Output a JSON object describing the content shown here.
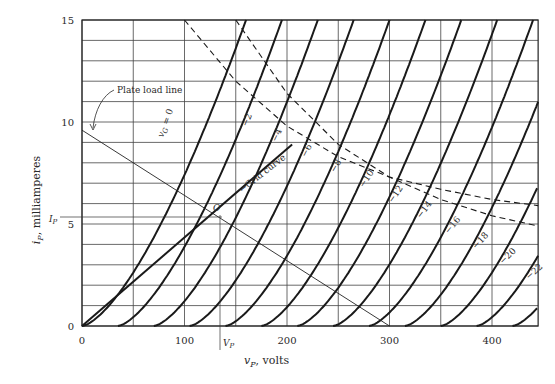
{
  "chart_data": {
    "type": "line",
    "title": "",
    "xlabel": "v_P, volts",
    "ylabel": "i_P, milliamperes",
    "xlim": [
      0,
      445
    ],
    "ylim": [
      0,
      15
    ],
    "x_ticks": [
      0,
      100,
      200,
      300,
      400
    ],
    "y_ticks": [
      0,
      5,
      10,
      15
    ],
    "grid": {
      "x_step": 50,
      "y_step": 1,
      "on": true
    },
    "legend": "none",
    "model": {
      "mu": 17.5,
      "k": 0.00741,
      "exponent": 1.5
    },
    "series": [
      {
        "name": "v_G = 0",
        "grid_voltage": 0,
        "label": "v_G = 0"
      },
      {
        "name": "-2",
        "grid_voltage": -2,
        "label": "−2"
      },
      {
        "name": "-4",
        "grid_voltage": -4,
        "label": "−4"
      },
      {
        "name": "-6",
        "grid_voltage": -6,
        "label": "−6"
      },
      {
        "name": "-8",
        "grid_voltage": -8,
        "label": "−8"
      },
      {
        "name": "-10",
        "grid_voltage": -10,
        "label": "−10"
      },
      {
        "name": "-12",
        "grid_voltage": -12,
        "label": "−12"
      },
      {
        "name": "-14",
        "grid_voltage": -14,
        "label": "−14"
      },
      {
        "name": "-16",
        "grid_voltage": -16,
        "label": "−16"
      },
      {
        "name": "-18",
        "grid_voltage": -18,
        "label": "−18"
      },
      {
        "name": "-20",
        "grid_voltage": -20,
        "label": "−20"
      },
      {
        "name": "-22",
        "grid_voltage": -22,
        "label": "−22"
      },
      {
        "name": "-24",
        "grid_voltage": -24,
        "label": "−24"
      }
    ],
    "plate_load_line": {
      "label": "Plate load line",
      "points": [
        [
          0,
          9.6
        ],
        [
          300,
          0
        ]
      ]
    },
    "grid_curve": {
      "label": "Grid curve",
      "points": [
        [
          0,
          0
        ],
        [
          205,
          8.9
        ]
      ]
    },
    "operating_point": {
      "label": "O",
      "v": 138,
      "i": 5.4,
      "v_label": "V_P",
      "i_label": "I_P"
    },
    "dashed_curves": [
      {
        "name": "upper-dissipation",
        "points": [
          [
            100,
            15
          ],
          [
            150,
            12
          ],
          [
            200,
            9.8
          ],
          [
            250,
            8.3
          ],
          [
            300,
            7.3
          ],
          [
            350,
            6.7
          ],
          [
            400,
            6.2
          ],
          [
            445,
            5.9
          ]
        ]
      },
      {
        "name": "lower-dissipation",
        "points": [
          [
            150,
            15
          ],
          [
            200,
            11.4
          ],
          [
            250,
            8.9
          ],
          [
            300,
            7.3
          ],
          [
            350,
            6.2
          ],
          [
            400,
            5.4
          ],
          [
            445,
            4.9
          ]
        ]
      }
    ]
  },
  "labels": {
    "y_axis": "milliamperes",
    "y_axis_var": "i",
    "y_axis_sub": "P",
    "x_axis_var": "v",
    "x_axis_sub": "P",
    "x_axis_unit": ", volts",
    "plate_load_line": "Plate load line",
    "grid_curve": "Grid curve",
    "op_point": "O",
    "vp": "V",
    "vp_sub": "P",
    "ip": "I",
    "ip_sub": "P",
    "vg0": "v",
    "vg0_sub": "G",
    "vg0_eq": " = 0"
  }
}
